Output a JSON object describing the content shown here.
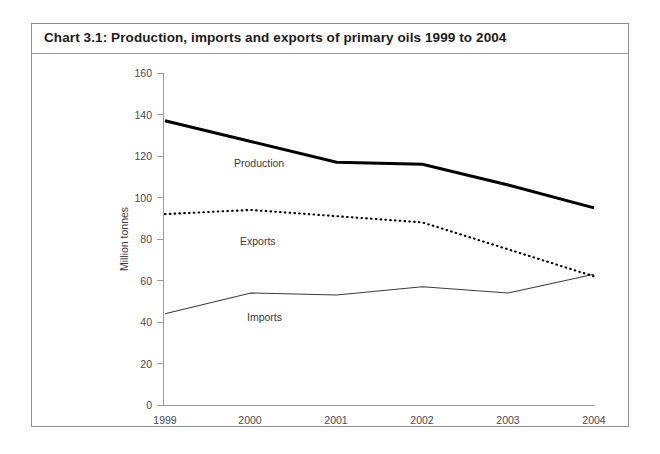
{
  "chart_frame": {
    "title": "Chart 3.1:  Production, imports and exports of primary oils 1999 to 2004"
  },
  "chart_data": {
    "type": "line",
    "title": "Chart 3.1:  Production, imports and exports of primary oils 1999 to 2004",
    "xlabel": "",
    "ylabel": "Million tonnes",
    "categories": [
      "1999",
      "2000",
      "2001",
      "2002",
      "2003",
      "2004"
    ],
    "x": [
      1999,
      2000,
      2001,
      2002,
      2003,
      2004
    ],
    "ylim": [
      0,
      160
    ],
    "yticks": [
      0,
      20,
      40,
      60,
      80,
      100,
      120,
      140,
      160
    ],
    "ytick_labels": [
      "0",
      "20",
      "40",
      "60",
      "80",
      "100",
      "120",
      "140",
      "160"
    ],
    "grid": false,
    "legend": "inline-series-labels",
    "series": [
      {
        "name": "Production",
        "style": "solid-thick",
        "values": [
          137,
          127,
          117,
          116,
          106,
          95
        ],
        "label_text": "Production"
      },
      {
        "name": "Exports",
        "style": "dotted",
        "values": [
          92,
          94,
          91,
          88,
          75,
          62
        ],
        "label_text": "Exports"
      },
      {
        "name": "Imports",
        "style": "solid-thin",
        "values": [
          44,
          54,
          53,
          57,
          54,
          63
        ],
        "label_text": "Imports"
      }
    ]
  }
}
